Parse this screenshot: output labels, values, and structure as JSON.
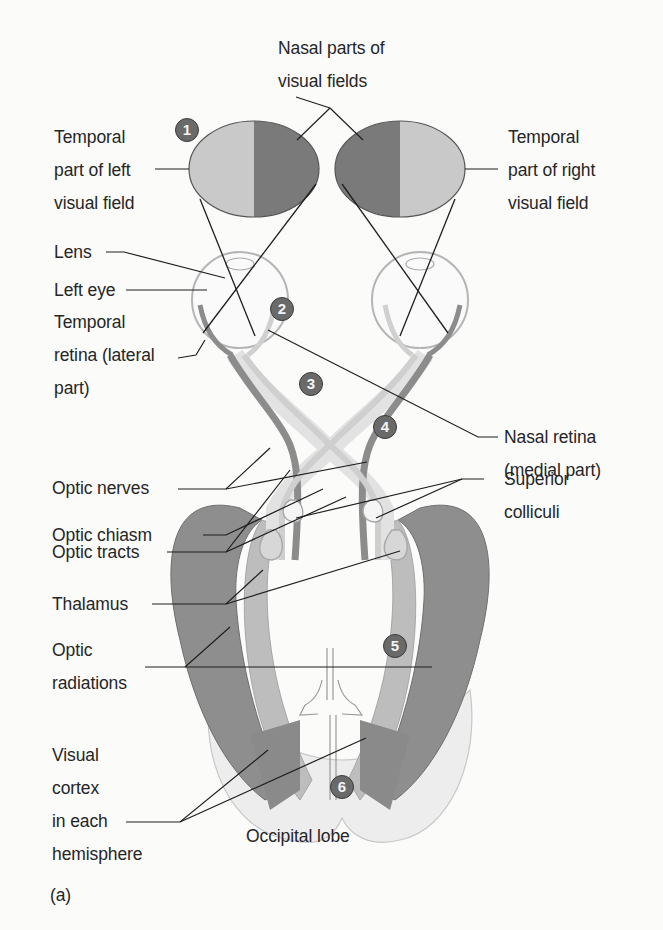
{
  "diagram": {
    "panel_label": "(a)",
    "colors": {
      "background": "#fbfbfa",
      "nasal_field": "#7a7a7a",
      "temporal_field": "#c9c9c9",
      "tract_dark": "#8c8c8c",
      "tract_light": "#d6d6d6",
      "marker_fill": "#6a6a6a",
      "leader_line": "#222222"
    },
    "labels": {
      "nasal_parts": [
        "Nasal parts of",
        "visual fields"
      ],
      "temporal_left": [
        "Temporal",
        "part of left",
        "visual field"
      ],
      "temporal_right": [
        "Temporal",
        "part of right",
        "visual field"
      ],
      "lens": "Lens",
      "left_eye": "Left eye",
      "temporal_retina": [
        "Temporal",
        "retina (lateral",
        "part)"
      ],
      "nasal_retina": [
        "Nasal retina",
        "(medial part)"
      ],
      "optic_nerves": "Optic nerves",
      "superior_colliculi": [
        "Superior",
        "colliculi"
      ],
      "optic_chiasm": "Optic chiasm",
      "optic_tracts": "Optic tracts",
      "thalamus": "Thalamus",
      "optic_radiations": [
        "Optic",
        "radiations"
      ],
      "visual_cortex": [
        "Visual",
        "cortex",
        "in each",
        "hemisphere"
      ],
      "occipital_lobe": "Occipital lobe"
    },
    "markers": [
      "1",
      "2",
      "3",
      "4",
      "5",
      "6"
    ]
  }
}
